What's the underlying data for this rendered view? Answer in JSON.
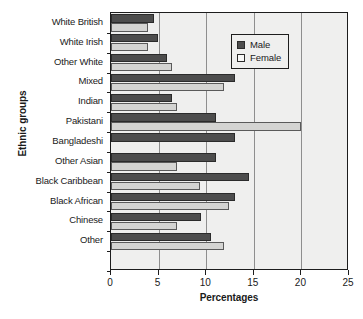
{
  "chart_data": {
    "type": "bar",
    "orientation": "horizontal",
    "title": "",
    "xlabel": "Percentages",
    "ylabel": "Ethnic groups",
    "xlim": [
      0,
      25
    ],
    "xticks": [
      0,
      5,
      10,
      15,
      20,
      25
    ],
    "xtick_labels": [
      "0",
      "5",
      "10",
      "15",
      "20",
      "25"
    ],
    "grid": true,
    "grid_axis": "x",
    "legend_position": "top-right",
    "categories": [
      "White British",
      "White Irish",
      "Other White",
      "Mixed",
      "Indian",
      "Pakistani",
      "Bangladeshi",
      "Other Asian",
      "Black Caribbean",
      "Black African",
      "Chinese",
      "Other"
    ],
    "series": [
      {
        "name": "Male",
        "color": "#4d4d4d",
        "values": [
          4.5,
          4.9,
          5.9,
          13.0,
          6.4,
          11.0,
          13.0,
          11.0,
          14.5,
          13.0,
          9.5,
          10.5
        ]
      },
      {
        "name": "Female",
        "color": "#d4d4d2",
        "values": [
          3.9,
          3.9,
          6.4,
          11.9,
          6.9,
          20.0,
          0.0,
          6.9,
          9.4,
          12.4,
          6.9,
          11.9
        ]
      }
    ]
  },
  "legend": {
    "entries": [
      {
        "label": "Male"
      },
      {
        "label": "Female"
      }
    ]
  },
  "colors": {
    "male": "#4d4d4d",
    "female": "#d4d4d2",
    "plot_background": "#efefee",
    "axis": "#1d1d1d",
    "gridline": "#8e8e8e",
    "page_background": "#ffffff"
  }
}
